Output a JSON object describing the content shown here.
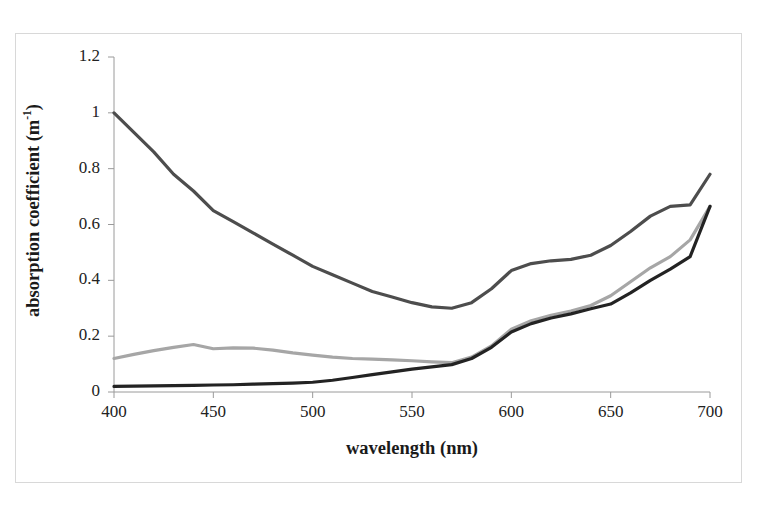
{
  "figure": {
    "background_color": "#ffffff",
    "frame_border_color": "#d8d8d8"
  },
  "axes": {
    "x_title": "wavelength  (nm)",
    "y_title_main": "absorption coefficient (m",
    "y_title_sup": "-1",
    "y_title_close": ")",
    "x_ticks": [
      "400",
      "450",
      "500",
      "550",
      "600",
      "650",
      "700"
    ],
    "y_ticks": [
      "0",
      "0.2",
      "0.4",
      "0.6",
      "0.8",
      "1",
      "1.2"
    ]
  },
  "chart_data": {
    "type": "line",
    "title": "",
    "xlabel": "wavelength  (nm)",
    "ylabel": "absorption coefficient (m-1)",
    "xlim": [
      400,
      700
    ],
    "ylim": [
      0,
      1.2
    ],
    "xticks": [
      400,
      450,
      500,
      550,
      600,
      650,
      700
    ],
    "yticks": [
      0,
      0.2,
      0.4,
      0.6,
      0.8,
      1.0,
      1.2
    ],
    "grid": false,
    "legend": "none",
    "x": [
      400,
      410,
      420,
      430,
      440,
      450,
      460,
      470,
      480,
      490,
      500,
      510,
      520,
      530,
      540,
      550,
      560,
      570,
      580,
      590,
      600,
      610,
      620,
      630,
      640,
      650,
      660,
      670,
      680,
      690,
      700
    ],
    "series": [
      {
        "name": "dark-gray-curve",
        "color": "#4d4d4d",
        "width": 3.2,
        "values": [
          1.0,
          0.93,
          0.86,
          0.78,
          0.72,
          0.65,
          0.61,
          0.57,
          0.53,
          0.49,
          0.45,
          0.42,
          0.39,
          0.36,
          0.34,
          0.32,
          0.305,
          0.3,
          0.32,
          0.37,
          0.435,
          0.46,
          0.47,
          0.475,
          0.49,
          0.525,
          0.575,
          0.63,
          0.665,
          0.67,
          0.78
        ]
      },
      {
        "name": "light-gray-curve",
        "color": "#a6a6a6",
        "width": 3.2,
        "values": [
          0.12,
          0.135,
          0.148,
          0.16,
          0.17,
          0.155,
          0.158,
          0.157,
          0.15,
          0.14,
          0.132,
          0.125,
          0.12,
          0.118,
          0.115,
          0.112,
          0.108,
          0.105,
          0.125,
          0.165,
          0.225,
          0.255,
          0.275,
          0.29,
          0.31,
          0.345,
          0.395,
          0.445,
          0.485,
          0.545,
          0.665
        ]
      },
      {
        "name": "black-curve",
        "color": "#232323",
        "width": 3.2,
        "values": [
          0.02,
          0.021,
          0.022,
          0.023,
          0.024,
          0.025,
          0.026,
          0.028,
          0.03,
          0.032,
          0.035,
          0.042,
          0.052,
          0.062,
          0.072,
          0.082,
          0.09,
          0.098,
          0.12,
          0.16,
          0.215,
          0.245,
          0.265,
          0.28,
          0.298,
          0.315,
          0.355,
          0.4,
          0.44,
          0.485,
          0.665
        ]
      }
    ]
  },
  "geometry": {
    "plot_left": 114,
    "plot_right": 710,
    "plot_top": 57,
    "plot_bottom": 392
  }
}
